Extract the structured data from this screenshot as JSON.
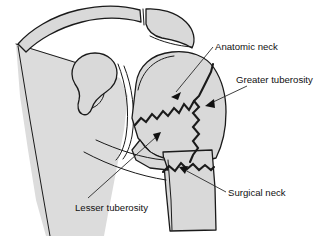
{
  "figure": {
    "background_color": "#ffffff",
    "bone_fill_color": "#d9d9d9",
    "outline_color": "#1a1a1a",
    "text_color": "#111111"
  },
  "labels": {
    "anatomic_neck": "Anatomic neck",
    "greater_tuberosity": "Greater tuberosity",
    "surgical_neck": "Surgical neck",
    "lesser_tuberosity": "Lesser tuberosity"
  },
  "structures": {
    "clavicle": "clavicle",
    "acromion": "acromion",
    "coracoid_process": "coracoid process",
    "scapula": "scapula",
    "glenoid": "glenoid",
    "humeral_head": "humeral head",
    "humeral_shaft": "humeral shaft"
  },
  "fracture_lines": {
    "anatomic_neck_fracture": "anatomic neck fracture line",
    "greater_tuberosity_fracture": "greater tuberosity fracture line",
    "surgical_neck_fracture": "surgical neck fracture line"
  }
}
